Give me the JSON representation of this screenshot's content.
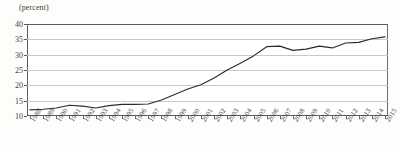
{
  "chart": {
    "unit_label": "(percent)",
    "bleed_text": "",
    "axis_color": "#2b2b2b",
    "grid_color": "#c9c9c9",
    "line_color": "#2b2b2b"
  },
  "chart_data": {
    "type": "line",
    "title": "",
    "subtitle": "",
    "xlabel": "",
    "ylabel": "(percent)",
    "ylim": [
      10,
      40
    ],
    "yticks": [
      10,
      15,
      20,
      25,
      30,
      35,
      40
    ],
    "grid": true,
    "legend": false,
    "legend_position": "none",
    "categories": [
      "1988",
      "1989",
      "1990",
      "1991",
      "1992",
      "1993",
      "1994",
      "1995",
      "1996",
      "1997",
      "1998",
      "1999",
      "2000",
      "2001",
      "2002",
      "2003",
      "2004",
      "2005",
      "2006",
      "2007",
      "2008",
      "2009",
      "2010",
      "2011",
      "2012",
      "2013",
      "2014",
      "2015"
    ],
    "values": [
      12.0,
      12.2,
      12.6,
      13.5,
      13.2,
      12.6,
      13.4,
      13.8,
      13.8,
      13.9,
      15.2,
      17.0,
      18.8,
      20.2,
      22.4,
      25.0,
      27.2,
      29.6,
      32.6,
      32.8,
      31.4,
      31.8,
      32.8,
      32.2,
      33.8,
      34.0,
      35.2,
      35.8
    ],
    "series": [
      {
        "name": "share",
        "values": [
          12.0,
          12.2,
          12.6,
          13.5,
          13.2,
          12.6,
          13.4,
          13.8,
          13.8,
          13.9,
          15.2,
          17.0,
          18.8,
          20.2,
          22.4,
          25.0,
          27.2,
          29.6,
          32.6,
          32.8,
          31.4,
          31.8,
          32.8,
          32.2,
          33.8,
          34.0,
          35.2,
          35.8
        ]
      }
    ]
  }
}
